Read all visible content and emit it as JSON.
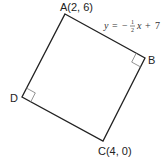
{
  "diagram": {
    "type": "geometry",
    "shape": "square",
    "vertices": {
      "A": {
        "label": "A(2, 6)",
        "x": 2,
        "y": 6
      },
      "B": {
        "label": "B"
      },
      "C": {
        "label": "C(4, 0)",
        "x": 4,
        "y": 0
      },
      "D": {
        "label": "D"
      }
    },
    "line_AB_equation": {
      "lhs": "y",
      "eq": "=",
      "sign": "−",
      "frac_num": "1",
      "frac_den": "2",
      "var": "x",
      "plus": "+",
      "const": "7"
    },
    "right_angle_marks": [
      "B",
      "D"
    ],
    "stroke_color": "#222222",
    "mark_color": "#888888"
  }
}
